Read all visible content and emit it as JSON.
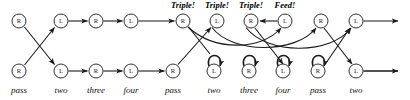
{
  "diagram": {
    "colors": {
      "stroke": "#1a1a1a",
      "node_fill": "#ffffff",
      "text": "#121212",
      "background": "#ffffff"
    },
    "geometry": {
      "width": 410,
      "height": 100,
      "top_row_y": 21,
      "bottom_row_y": 71,
      "node_radius": 7
    },
    "nodes": {
      "top": [
        {
          "id": "t0",
          "label": "R",
          "x": 19,
          "y": 21
        },
        {
          "id": "t1",
          "label": "L",
          "x": 61,
          "y": 21
        },
        {
          "id": "t2",
          "label": "R",
          "x": 96,
          "y": 21
        },
        {
          "id": "t3",
          "label": "L",
          "x": 131,
          "y": 21
        },
        {
          "id": "t4",
          "label": "R",
          "x": 183,
          "y": 21
        },
        {
          "id": "t5",
          "label": "L",
          "x": 217,
          "y": 21
        },
        {
          "id": "t6",
          "label": "R",
          "x": 251,
          "y": 21
        },
        {
          "id": "t7",
          "label": "L",
          "x": 285,
          "y": 21
        },
        {
          "id": "t8",
          "label": "R",
          "x": 321,
          "y": 21
        },
        {
          "id": "t9",
          "label": "L",
          "x": 356,
          "y": 21
        }
      ],
      "bottom": [
        {
          "id": "b0",
          "label": "R",
          "x": 19,
          "y": 71
        },
        {
          "id": "b1",
          "label": "L",
          "x": 61,
          "y": 71
        },
        {
          "id": "b2",
          "label": "R",
          "x": 96,
          "y": 71
        },
        {
          "id": "b3",
          "label": "L",
          "x": 131,
          "y": 71
        },
        {
          "id": "b4",
          "label": "R",
          "x": 173,
          "y": 71
        },
        {
          "id": "b5",
          "label": "L",
          "x": 214,
          "y": 71
        },
        {
          "id": "b6",
          "label": "R",
          "x": 249,
          "y": 71
        },
        {
          "id": "b7",
          "label": "L",
          "x": 283,
          "y": 71
        },
        {
          "id": "b8",
          "label": "R",
          "x": 318,
          "y": 71
        },
        {
          "id": "b9",
          "label": "L",
          "x": 356,
          "y": 71
        }
      ]
    },
    "column_labels": [
      {
        "text": "pass",
        "x": 19
      },
      {
        "text": "two",
        "x": 61
      },
      {
        "text": "three",
        "x": 96
      },
      {
        "text": "four",
        "x": 131
      },
      {
        "text": "pass",
        "x": 173
      },
      {
        "text": "two",
        "x": 214
      },
      {
        "text": "three",
        "x": 249
      },
      {
        "text": "four",
        "x": 283
      },
      {
        "text": "pass",
        "x": 318
      },
      {
        "text": "two",
        "x": 356
      }
    ],
    "annotations": [
      {
        "text": "Triple!",
        "x": 183,
        "y": 1
      },
      {
        "text": "Triple!",
        "x": 217,
        "y": 1
      },
      {
        "text": "Triple!",
        "x": 251,
        "y": 1
      },
      {
        "text": "Feed!",
        "x": 285,
        "y": 1
      }
    ],
    "edges": {
      "straight_top": [
        {
          "from": "t1",
          "to": "t2"
        },
        {
          "from": "t2",
          "to": "t3"
        },
        {
          "from": "t3",
          "to": "t4"
        },
        {
          "from": "t9",
          "to": "open-right-top"
        }
      ],
      "straight_bottom": [
        {
          "from": "b1",
          "to": "b2"
        },
        {
          "from": "b2",
          "to": "b3"
        },
        {
          "from": "b3",
          "to": "b4"
        },
        {
          "from": "b9",
          "to": "open-right-bottom"
        }
      ],
      "crossings": [
        {
          "from": "t0",
          "to": "b1"
        },
        {
          "from": "b0",
          "to": "t1"
        },
        {
          "from": "b4",
          "to": "t5"
        },
        {
          "from": "t4",
          "to": "b5_region"
        },
        {
          "from": "t8",
          "to": "b9"
        },
        {
          "from": "b8",
          "to": "t9"
        }
      ],
      "reverse_top": [
        {
          "from": "t7",
          "to": "t6",
          "direction": "leftward"
        }
      ],
      "arcs": [
        {
          "from": "t4",
          "to": "t7",
          "sag": "down"
        },
        {
          "from": "t5",
          "to": "t8",
          "sag": "down"
        },
        {
          "from": "t6",
          "to": "t9",
          "sag": "down"
        }
      ],
      "self_loops": [
        {
          "node": "b5"
        },
        {
          "node": "b6"
        },
        {
          "node": "b7"
        },
        {
          "node": "b8"
        }
      ]
    }
  }
}
